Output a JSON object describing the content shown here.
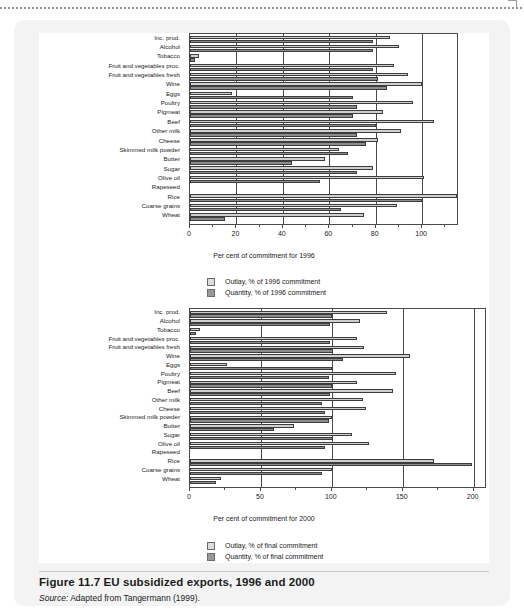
{
  "figure": {
    "caption_title": "Figure 11.7  EU subsidized exports, 1996 and 2000",
    "source_prefix": "Source:",
    "source_text": " Adapted from Tangermann (1999)."
  },
  "chart_data": [
    {
      "type": "bar",
      "orientation": "horizontal",
      "title": "",
      "xlabel": "Per cent of commitment for 1996",
      "ylabel": "",
      "xlim": [
        0,
        115
      ],
      "xticks": [
        0,
        20,
        40,
        60,
        80,
        100
      ],
      "grid": true,
      "legend_position": "below",
      "categories": [
        "Inc. prod.",
        "Alcohol",
        "Tobacco",
        "Fruit and vegetables proc.",
        "Fruit and vegetables fresh",
        "Wine",
        "Eggs",
        "Poultry",
        "Pigmeat",
        "Beef",
        "Other milk",
        "Cheese",
        "Skimmed milk powder",
        "Butter",
        "Sugar",
        "Olive oil",
        "Rapeseed",
        "Rice",
        "Coarse grains",
        "Wheat"
      ],
      "series": [
        {
          "name": "Outlay, % of 1996 commitment",
          "values": [
            86,
            90,
            4,
            88,
            94,
            100,
            18,
            96,
            83,
            105,
            91,
            81,
            64,
            58,
            79,
            101,
            0,
            115,
            89,
            75
          ]
        },
        {
          "name": "Quantity, % of 1996 commitment",
          "values": [
            79,
            79,
            2,
            79,
            81,
            85,
            70,
            72,
            70,
            80,
            72,
            76,
            68,
            44,
            72,
            56,
            0,
            100,
            65,
            15
          ]
        }
      ]
    },
    {
      "type": "bar",
      "orientation": "horizontal",
      "title": "",
      "xlabel": "Per cent of commitment for 2000",
      "ylabel": "",
      "xlim": [
        0,
        208
      ],
      "xticks": [
        0,
        50,
        100,
        150,
        200
      ],
      "grid": true,
      "legend_position": "below",
      "categories": [
        "Inc. prod.",
        "Alcohol",
        "Tobacco",
        "Fruit and vegetables proc.",
        "Fruit and vegetables fresh",
        "Wine",
        "Eggs",
        "Poultry",
        "Pigmeat",
        "Beef",
        "Other milk",
        "Cheese",
        "Skimmed milk powder",
        "Butter",
        "Sugar",
        "Olive oil",
        "Rapeseed",
        "Rice",
        "Coarse grains",
        "Wheat"
      ],
      "series": [
        {
          "name": "Outlay, % of final commitment",
          "values": [
            139,
            120,
            7,
            118,
            123,
            155,
            26,
            145,
            118,
            143,
            122,
            124,
            100,
            73,
            114,
            126,
            0,
            172,
            100,
            22
          ]
        },
        {
          "name": "Quantity, % of final commitment",
          "values": [
            100,
            99,
            4,
            99,
            101,
            108,
            100,
            98,
            100,
            99,
            93,
            95,
            98,
            59,
            101,
            95,
            0,
            199,
            93,
            18
          ]
        }
      ]
    }
  ],
  "legends": [
    {
      "outlay": "Outlay, % of 1996 commitment",
      "quantity": "Quantity, % of 1996 commitment"
    },
    {
      "outlay": "Outlay, % of final commitment",
      "quantity": "Quantity, % of final commitment"
    }
  ],
  "colors": {
    "outlay_fill": "#cfcfcf",
    "quantity_fill": "#8c8c8c",
    "axis": "#4a4a4a",
    "card_bg": "#f3f3f3",
    "plot_bg": "#ffffff"
  }
}
